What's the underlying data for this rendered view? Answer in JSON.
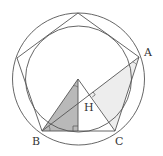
{
  "diagram": {
    "colors": {
      "stroke": "#555555",
      "dark_fill": "#b8b8b8",
      "light_fill": "#ececec",
      "label": "#333333"
    },
    "labels": {
      "A": "A",
      "B": "B",
      "C": "C",
      "H": "H"
    },
    "outer_circle": {
      "cx": 78.5,
      "cy": 79,
      "r": 66
    },
    "inner_circle": {
      "cx": 78.5,
      "cy": 79,
      "r": 53
    },
    "pentagon": {
      "vertices": {
        "top": [
          78,
          13
        ],
        "left": [
          17,
          58
        ],
        "B": [
          42,
          131
        ],
        "C": [
          115,
          131
        ],
        "A": [
          139,
          57
        ]
      }
    },
    "center": [
      78,
      79
    ],
    "foot_of_perpendicular": [
      78,
      131
    ],
    "H": [
      90,
      94
    ],
    "shaded_triangle_dark": "O-B-foot",
    "shaded_triangle_light": "H-A-C"
  }
}
